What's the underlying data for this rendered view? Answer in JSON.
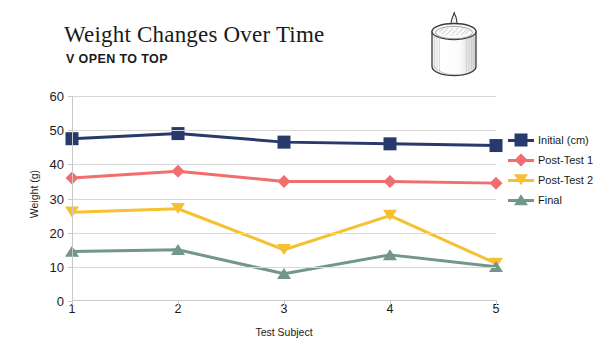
{
  "chart_data": {
    "type": "line",
    "title": "Weight Changes Over Time",
    "subtitle": "V OPEN TO TOP",
    "xlabel": "Test Subject",
    "ylabel": "Weight (g)",
    "categories": [
      "1",
      "2",
      "3",
      "4",
      "5"
    ],
    "xlim": [
      1,
      5
    ],
    "ylim": [
      0,
      60
    ],
    "yticks": [
      "60",
      "50",
      "40",
      "30",
      "20",
      "10",
      "0"
    ],
    "ytick_values": [
      60,
      50,
      40,
      30,
      20,
      10,
      0
    ],
    "grid": "horizontal",
    "legend_position": "right",
    "series": [
      {
        "name": "Initial (cm)",
        "color": "#283A6B",
        "marker": "square",
        "values": [
          47.5,
          49,
          46.5,
          46,
          45.5
        ]
      },
      {
        "name": "Post-Test 1",
        "color": "#F26D6D",
        "marker": "diamond",
        "values": [
          36,
          38,
          35,
          35,
          34.5
        ]
      },
      {
        "name": "Post-Test 2",
        "color": "#F5C032",
        "marker": "triangle-down",
        "values": [
          26,
          27,
          15,
          25,
          11
        ]
      },
      {
        "name": "Final",
        "color": "#72968C",
        "marker": "triangle-up",
        "values": [
          14.5,
          15,
          8,
          13.5,
          10
        ]
      }
    ]
  },
  "illustration": {
    "name": "candle-sketch",
    "alt": "Hand-drawn sketch of a cylindrical candle with wick"
  },
  "legend": {
    "items": [
      {
        "label": "Initial (cm)"
      },
      {
        "label": "Post-Test 1"
      },
      {
        "label": "Post-Test 2"
      },
      {
        "label": "Final"
      }
    ]
  }
}
